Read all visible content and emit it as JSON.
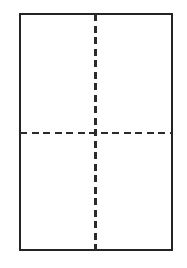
{
  "figure": {
    "canvas": {
      "width": 187,
      "height": 268,
      "background_color": "#ffffff"
    },
    "rectangle": {
      "name": "outer-rectangle",
      "x": 20,
      "y": 14,
      "width": 152,
      "height": 236,
      "stroke_color": "#242424",
      "stroke_width": 2.2,
      "fill_color": "#ffffff"
    },
    "centerlines": [
      {
        "name": "vertical-centerline",
        "orientation": "vertical",
        "position": 95.5,
        "start": 14,
        "end": 250,
        "stroke_color": "#2b2b2b",
        "stroke_width": 2.6,
        "dash_length": 7,
        "gap_length": 4.5
      },
      {
        "name": "horizontal-centerline",
        "orientation": "horizontal",
        "position": 133,
        "start": 20,
        "end": 172,
        "stroke_color": "#2b2b2b",
        "stroke_width": 2.6,
        "dash_length": 7,
        "gap_length": 4.5
      }
    ],
    "quadrants": [
      {
        "name": "quadrant-top-left",
        "label": ""
      },
      {
        "name": "quadrant-top-right",
        "label": ""
      },
      {
        "name": "quadrant-bottom-left",
        "label": ""
      },
      {
        "name": "quadrant-bottom-right",
        "label": ""
      }
    ]
  }
}
